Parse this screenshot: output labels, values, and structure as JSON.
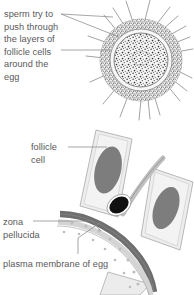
{
  "figure": {
    "title_absent": true,
    "background_color": "#ffffff",
    "text_color": "#58585a",
    "labels": [
      {
        "id": "sperm",
        "text": "sperm try to\npush through\nthe layers of\nfollicle cells\naround the\negg",
        "name": "label-sperm-try-to-push-through"
      },
      {
        "id": "follicle",
        "text": "follicle\ncell",
        "name": "label-follicle-cell"
      },
      {
        "id": "zona",
        "text": "zona\npellucida",
        "name": "label-zona-pellucida"
      },
      {
        "id": "plasma",
        "text": "plasma membrane of egg",
        "name": "label-plasma-membrane-of-egg"
      }
    ],
    "colors": {
      "stipple_dark": "#3c3c3c",
      "egg_outline": "#6e6e6e",
      "cell_fill": "#ececec",
      "cell_outline": "#b4b4b4",
      "nucleus_fill": "#7a7a7a",
      "zona_band": "#6e6e6e",
      "zona_inner": "#d2d2d2",
      "sperm_head": "#111111",
      "leader_line": "#7a7a7a"
    },
    "panels": {
      "top": "egg surrounded by follicle cell corona with sperm radiating inward",
      "bottom": "cross-section through follicle cells, zona pellucida and egg plasma membrane with one sperm penetrating"
    }
  }
}
